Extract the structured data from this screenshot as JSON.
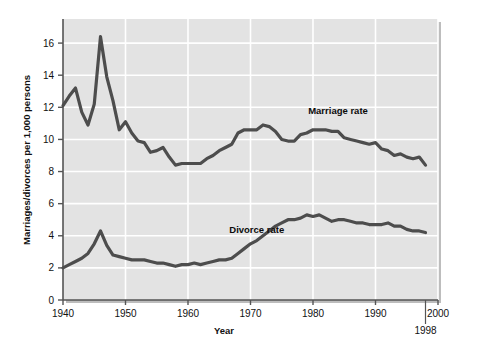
{
  "chart_data": {
    "type": "line",
    "title": "",
    "xlabel": "Year",
    "ylabel": "Marriages/divorces per 1,000 persons",
    "xlim": [
      1940,
      2000
    ],
    "ylim": [
      0,
      17.5
    ],
    "xticks": [
      1940,
      1950,
      1960,
      1970,
      1980,
      1990,
      2000
    ],
    "xtick_labels": [
      "1940",
      "1950",
      "1960",
      "1970",
      "1980",
      "1990",
      "2000"
    ],
    "yticks": [
      0,
      2,
      4,
      6,
      8,
      10,
      12,
      14,
      16
    ],
    "ytick_labels": [
      "0",
      "2",
      "4",
      "6",
      "8",
      "10",
      "12",
      "14",
      "16"
    ],
    "grid": true,
    "legend_position": "inline-annotation",
    "annotations": [
      {
        "text": "Marriage rate",
        "x": 1984,
        "y": 11.6
      },
      {
        "text": "Divorce rate",
        "x": 1971,
        "y": 4.2
      },
      {
        "text": "1998",
        "x": 1998,
        "y": -1.6
      }
    ],
    "x": [
      1940,
      1941,
      1942,
      1943,
      1944,
      1945,
      1946,
      1947,
      1948,
      1949,
      1950,
      1951,
      1952,
      1953,
      1954,
      1955,
      1956,
      1957,
      1958,
      1959,
      1960,
      1961,
      1962,
      1963,
      1964,
      1965,
      1966,
      1967,
      1968,
      1969,
      1970,
      1971,
      1972,
      1973,
      1974,
      1975,
      1976,
      1977,
      1978,
      1979,
      1980,
      1981,
      1982,
      1983,
      1984,
      1985,
      1986,
      1987,
      1988,
      1989,
      1990,
      1991,
      1992,
      1993,
      1994,
      1995,
      1996,
      1997,
      1998
    ],
    "series": [
      {
        "name": "Marriage rate",
        "color": "#4d4d4d",
        "values": [
          12.1,
          12.7,
          13.2,
          11.7,
          10.9,
          12.2,
          16.4,
          13.9,
          12.4,
          10.6,
          11.1,
          10.4,
          9.9,
          9.8,
          9.2,
          9.3,
          9.5,
          8.9,
          8.4,
          8.5,
          8.5,
          8.5,
          8.5,
          8.8,
          9.0,
          9.3,
          9.5,
          9.7,
          10.4,
          10.6,
          10.6,
          10.6,
          10.9,
          10.8,
          10.5,
          10.0,
          9.9,
          9.9,
          10.3,
          10.4,
          10.6,
          10.6,
          10.6,
          10.5,
          10.5,
          10.1,
          10.0,
          9.9,
          9.8,
          9.7,
          9.8,
          9.4,
          9.3,
          9.0,
          9.1,
          8.9,
          8.8,
          8.9,
          8.4
        ]
      },
      {
        "name": "Divorce rate",
        "color": "#4d4d4d",
        "values": [
          2.0,
          2.2,
          2.4,
          2.6,
          2.9,
          3.5,
          4.3,
          3.4,
          2.8,
          2.7,
          2.6,
          2.5,
          2.5,
          2.5,
          2.4,
          2.3,
          2.3,
          2.2,
          2.1,
          2.2,
          2.2,
          2.3,
          2.2,
          2.3,
          2.4,
          2.5,
          2.5,
          2.6,
          2.9,
          3.2,
          3.5,
          3.7,
          4.0,
          4.3,
          4.6,
          4.8,
          5.0,
          5.0,
          5.1,
          5.3,
          5.2,
          5.3,
          5.1,
          4.9,
          5.0,
          5.0,
          4.9,
          4.8,
          4.8,
          4.7,
          4.7,
          4.7,
          4.8,
          4.6,
          4.6,
          4.4,
          4.3,
          4.3,
          4.2
        ]
      }
    ]
  },
  "figure": {
    "background": "#ffffff",
    "plot_background": "#e3e3e3",
    "grid_color": "#ffffff",
    "axis_color": "#555555",
    "line_color": "#4d4d4d"
  }
}
